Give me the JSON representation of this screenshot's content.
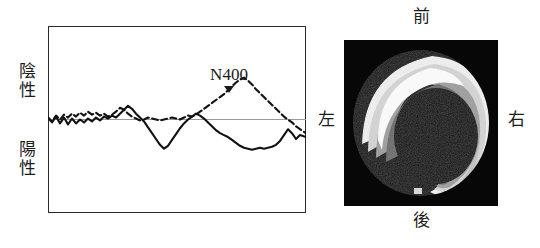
{
  "figure": {
    "panels": [
      "erp-waveform",
      "topographic-map"
    ]
  },
  "erp": {
    "y_axis": {
      "negative_label_line1": "陰",
      "negative_label_line2": "性",
      "positive_label_line1": "陽",
      "positive_label_line2": "性"
    },
    "annotation": {
      "component_label": "N400",
      "marker_icon": "down-triangle-marker"
    },
    "frame_color": "#2b2b2b",
    "baseline_color": "#9a9a9a",
    "trace_color": "#111111"
  },
  "topomap": {
    "orientation": {
      "front": "前",
      "back": "後",
      "left": "左",
      "right": "右"
    },
    "background_color": "#070707",
    "scale_colors": [
      "#070707",
      "#3a3a3a",
      "#6e6e6e",
      "#a8a8a8",
      "#d2d2d2",
      "#f2f2f2"
    ]
  },
  "chart_data": {
    "type": "line",
    "title": "",
    "subtitle": "",
    "xlabel": "",
    "ylabel": "陰性 / 陽性",
    "xlim": [
      0,
      258
    ],
    "ylim": [
      -96,
      96
    ],
    "grid": false,
    "legend": "none",
    "annotations": [
      {
        "text": "N400",
        "x": 181,
        "y": 44,
        "marker": "down-triangle"
      }
    ],
    "baseline_y": 0,
    "series": [
      {
        "name": "solid-trace",
        "style": "solid",
        "x": [
          0,
          4,
          8,
          12,
          16,
          20,
          24,
          28,
          32,
          36,
          40,
          44,
          48,
          52,
          56,
          60,
          64,
          68,
          72,
          76,
          80,
          84,
          88,
          92,
          96,
          100,
          104,
          108,
          112,
          116,
          120,
          124,
          128,
          132,
          136,
          140,
          144,
          148,
          152,
          156,
          160,
          164,
          168,
          172,
          176,
          180,
          184,
          188,
          192,
          196,
          200,
          204,
          208,
          212,
          216,
          220,
          224,
          228,
          232,
          236,
          240,
          244,
          248,
          252,
          258
        ],
        "y": [
          2,
          -3,
          3,
          -4,
          2,
          -5,
          1,
          -4,
          0,
          -3,
          1,
          -2,
          2,
          -1,
          3,
          1,
          4,
          2,
          6,
          10,
          14,
          11,
          6,
          2,
          -2,
          -8,
          -14,
          -20,
          -26,
          -30,
          -27,
          -21,
          -15,
          -9,
          -4,
          0,
          3,
          6,
          4,
          1,
          -3,
          -7,
          -11,
          -14,
          -16,
          -18,
          -21,
          -24,
          -27,
          -29,
          -30,
          -31,
          -30,
          -29,
          -30,
          -29,
          -28,
          -26,
          -22,
          -16,
          -10,
          -14,
          -20,
          -16,
          -18
        ]
      },
      {
        "name": "dashed-trace",
        "style": "dashed",
        "x": [
          0,
          4,
          8,
          12,
          16,
          20,
          24,
          28,
          32,
          36,
          40,
          44,
          48,
          52,
          56,
          60,
          64,
          68,
          72,
          76,
          80,
          84,
          88,
          92,
          96,
          100,
          104,
          108,
          112,
          116,
          120,
          124,
          128,
          132,
          136,
          140,
          144,
          148,
          152,
          156,
          160,
          164,
          168,
          172,
          176,
          180,
          184,
          188,
          192,
          196,
          200,
          204,
          208,
          212,
          216,
          220,
          224,
          228,
          232,
          236,
          240,
          244,
          248,
          252,
          258
        ],
        "y": [
          2,
          -2,
          4,
          0,
          5,
          2,
          6,
          3,
          7,
          4,
          8,
          5,
          7,
          4,
          6,
          3,
          5,
          8,
          12,
          10,
          6,
          3,
          1,
          -1,
          0,
          2,
          1,
          0,
          -1,
          0,
          1,
          2,
          1,
          0,
          2,
          4,
          3,
          5,
          8,
          11,
          14,
          17,
          20,
          23,
          26,
          30,
          34,
          38,
          41,
          43,
          40,
          36,
          31,
          27,
          23,
          19,
          15,
          11,
          7,
          3,
          0,
          -3,
          -7,
          -10,
          -14
        ]
      }
    ]
  }
}
